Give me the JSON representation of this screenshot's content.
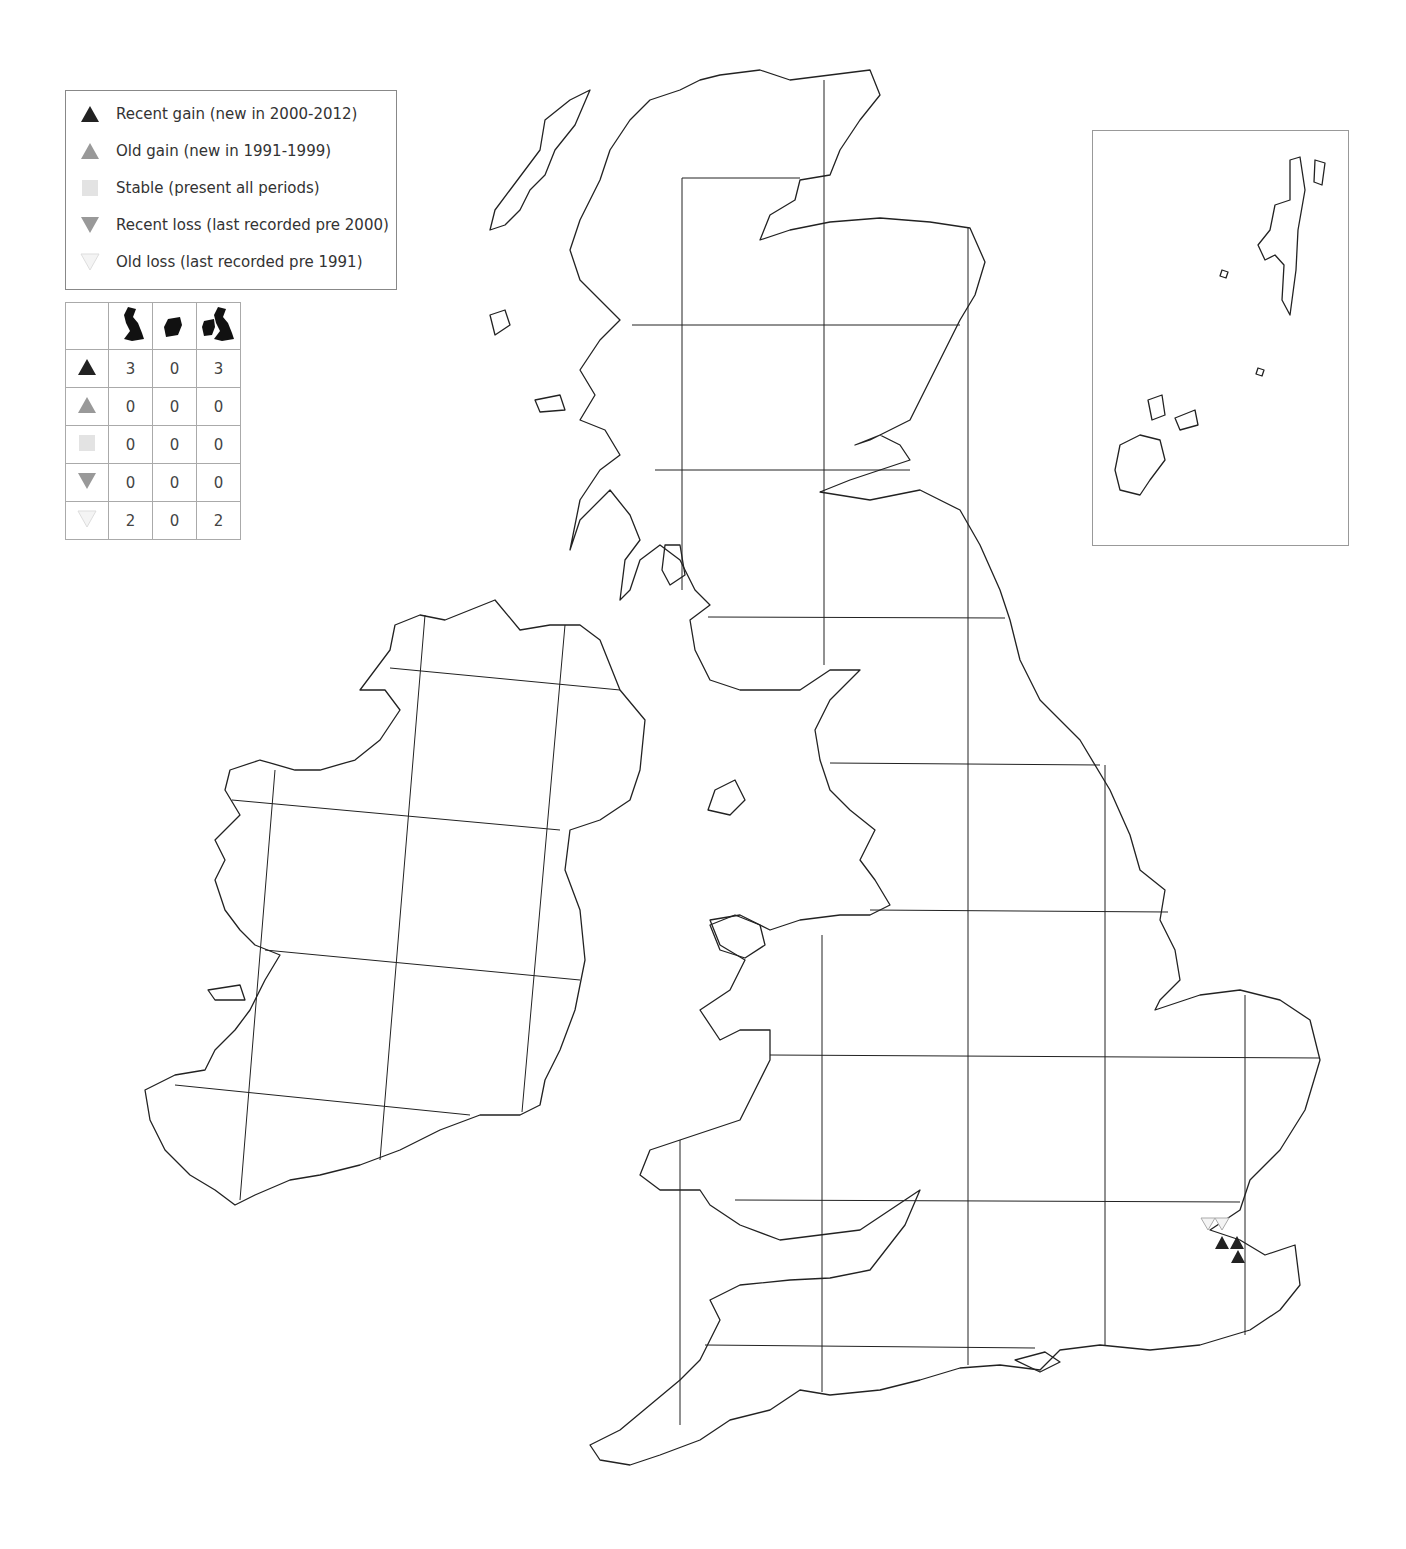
{
  "legend": {
    "items": [
      {
        "symbol": "triangle-up",
        "color": "#222222",
        "label": "Recent gain (new in 2000-2012)"
      },
      {
        "symbol": "triangle-up",
        "color": "#999999",
        "label": "Old gain (new in 1991-1999)"
      },
      {
        "symbol": "square",
        "color": "#e3e3e3",
        "label": "Stable (present all periods)"
      },
      {
        "symbol": "triangle-down",
        "color": "#999999",
        "label": "Recent loss (last recorded pre 2000)"
      },
      {
        "symbol": "triangle-down",
        "color": "#f2f2f2",
        "label": "Old loss (last recorded pre 1991)"
      }
    ]
  },
  "counts_table": {
    "columns": [
      "Great Britain",
      "Ireland",
      "Britain and Ireland"
    ],
    "rows": [
      {
        "category": "Recent gain",
        "values": [
          "3",
          "0",
          "3"
        ]
      },
      {
        "category": "Old gain",
        "values": [
          "0",
          "0",
          "0"
        ]
      },
      {
        "category": "Stable",
        "values": [
          "0",
          "0",
          "0"
        ]
      },
      {
        "category": "Recent loss",
        "values": [
          "0",
          "0",
          "0"
        ]
      },
      {
        "category": "Old loss",
        "values": [
          "2",
          "0",
          "2"
        ]
      }
    ]
  },
  "markers": [
    {
      "type": "old-loss",
      "x": 1208,
      "y": 1223
    },
    {
      "type": "old-loss",
      "x": 1222,
      "y": 1223
    },
    {
      "type": "recent-gain",
      "x": 1222,
      "y": 1243
    },
    {
      "type": "recent-gain",
      "x": 1237,
      "y": 1243
    },
    {
      "type": "recent-gain",
      "x": 1238,
      "y": 1257
    }
  ],
  "inset": {
    "label": "Shetland and Orkney inset"
  }
}
